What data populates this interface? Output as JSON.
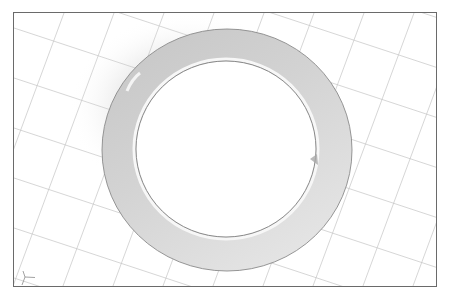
{
  "viewport": {
    "name": "3d-model-viewport",
    "background": "#ffffff",
    "frame_color": "#6a6a6a",
    "grid": {
      "color": "#c4c4c4",
      "family_a_angle_deg": 18,
      "family_b_angle_deg": -20,
      "spacing_px": 50
    },
    "model": {
      "type": "flat-ring-washer",
      "outer": {
        "cx": 213,
        "cy": 137,
        "rx": 125,
        "ry": 121
      },
      "inner": {
        "cx": 212,
        "cy": 136,
        "rx": 90,
        "ry": 88
      },
      "shade_dark": "#c6c6c6",
      "shade_light": "#eeeeee",
      "edge_color": "#8a8a8a"
    },
    "axis_triad": {
      "x": 11,
      "y": 264
    }
  }
}
